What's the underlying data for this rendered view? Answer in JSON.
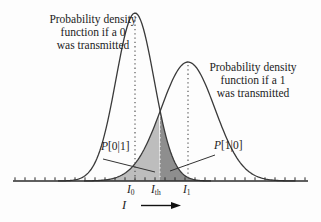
{
  "figure": {
    "left_label": {
      "line1": "Probability density",
      "line2": "function if a 0",
      "line3": "was transmitted"
    },
    "right_label": {
      "line1": "Probability density",
      "line2": "function if a 1",
      "line3": "was transmitted"
    },
    "error_left": {
      "p": "P",
      "bracket": "[0|1]"
    },
    "error_right": {
      "p": "P",
      "bracket": "[1|0]"
    },
    "axis_labels": {
      "i0": {
        "base": "I",
        "sub": "0"
      },
      "ith": {
        "base": "I",
        "sub": "th"
      },
      "i1": {
        "base": "I",
        "sub": "1"
      }
    },
    "x_axis_symbol": "I"
  },
  "diagram": {
    "baseline_y": 181,
    "threshold_x": 160,
    "axis": {
      "x_start": 13,
      "x_end": 308,
      "tick_start": 15,
      "tick_step": 10,
      "tick_count": 30,
      "tick_len": 3
    },
    "curves": {
      "zero": {
        "mu": 135,
        "sigma": 19,
        "amp": 168,
        "range": [
          58,
          212
        ]
      },
      "one": {
        "mu": 188,
        "sigma": 27,
        "amp": 119,
        "range": [
          84,
          296
        ]
      }
    },
    "leaders": [
      [
        103,
        159,
        155,
        172
      ],
      [
        215,
        155,
        170,
        171
      ]
    ],
    "arrow": {
      "x1": 141,
      "x2": 171,
      "tip": 181,
      "y": 205.5,
      "half": 3.6
    },
    "colors": {
      "light_fill": "#bdbdbd",
      "dark_fill": "#8e8e8e",
      "stroke": "#3a3a3a",
      "axis": "#2b2b2b",
      "dotted": "#4a4a4a",
      "dotted_light": "#f2f2f2",
      "leader": "#333333",
      "arrow": "#111111"
    }
  }
}
